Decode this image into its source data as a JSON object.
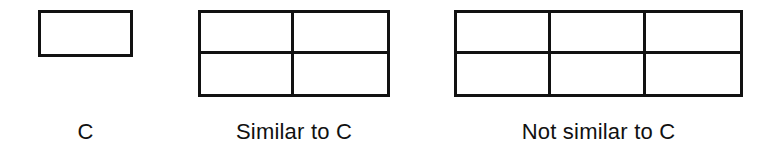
{
  "diagram": {
    "kind": "geometric-similarity-comparison",
    "background_color": "#ffffff",
    "stroke_color": "#111111",
    "stroke_width_px": 3,
    "figures": [
      {
        "id": "reference",
        "caption": "C",
        "shape": "rectangle",
        "columns": 1,
        "rows": 2,
        "cell_count": 1,
        "width_px": 95,
        "height_px": 47,
        "note": "single undivided rectangle, width to height about 2 to 1"
      },
      {
        "id": "similar",
        "caption": "Similar to C",
        "shape": "grid-rectangle",
        "columns": 2,
        "rows": 2,
        "cell_count": 4,
        "width_px": 192,
        "height_px": 87,
        "note": "two by two grid, overall width to height about 2 to 1"
      },
      {
        "id": "not-similar",
        "caption": "Not similar to C",
        "shape": "grid-rectangle",
        "columns": 3,
        "rows": 2,
        "cell_count": 6,
        "width_px": 289,
        "height_px": 87,
        "note": "three by two grid, overall width to height about 3 to 1"
      }
    ]
  }
}
